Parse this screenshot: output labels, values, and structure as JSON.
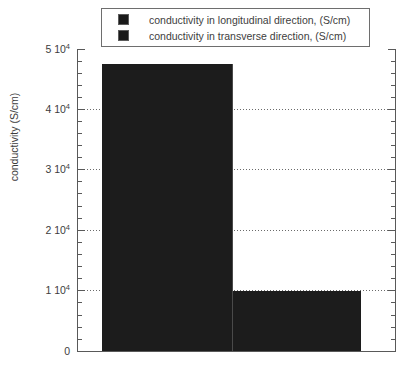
{
  "legend": {
    "position": "top-center",
    "entries": [
      {
        "swatch_color": "#1a1a1a",
        "label": "conductivity in longitudinal direction, (S/cm)"
      },
      {
        "swatch_color": "#1a1a1a",
        "label": "conductivity in transverse direction, (S/cm)"
      }
    ]
  },
  "axis": {
    "ylabel": "conductivity (S/cm)",
    "ticks": [
      {
        "value": 50000,
        "mantissa": "5 10",
        "exponent": "4",
        "text": "5 10⁴"
      },
      {
        "value": 40000,
        "mantissa": "4 10",
        "exponent": "4",
        "text": "4 10⁴"
      },
      {
        "value": 30000,
        "mantissa": "3 10",
        "exponent": "4",
        "text": "3 10⁴"
      },
      {
        "value": 20000,
        "mantissa": "2 10",
        "exponent": "4",
        "text": "2 10⁴"
      },
      {
        "value": 10000,
        "mantissa": "1 10",
        "exponent": "4",
        "text": "1 10⁴"
      },
      {
        "value": 0,
        "mantissa": "0",
        "exponent": "",
        "text": "0"
      }
    ]
  },
  "chart_data": {
    "type": "bar",
    "title": "",
    "xlabel": "",
    "ylabel": "conductivity (S/cm)",
    "categories": [
      "conductivity in longitudinal direction, (S/cm)",
      "conductivity in transverse direction, (S/cm)"
    ],
    "values": [
      47500,
      10000
    ],
    "value_texts": [
      "4.75 10⁴",
      "1 10⁴"
    ],
    "ylim": [
      0,
      50000
    ],
    "ytick_values": [
      0,
      10000,
      20000,
      30000,
      40000,
      50000
    ],
    "ytick_labels": [
      "0",
      "1 10⁴",
      "2 10⁴",
      "3 10⁴",
      "4 10⁴",
      "5 10⁴"
    ],
    "minor_ticks_per_major": 5,
    "grid": {
      "y": true,
      "x": false,
      "style": "dotted"
    },
    "legend": {
      "position": "top-center",
      "entries": [
        "conductivity in longitudinal direction, (S/cm)",
        "conductivity in transverse direction, (S/cm)"
      ]
    },
    "bar_color": "#1c1c1c",
    "axis_color": "#595959",
    "text_color": "#3d3d3d",
    "background": "#ffffff",
    "xtick_labels": []
  }
}
